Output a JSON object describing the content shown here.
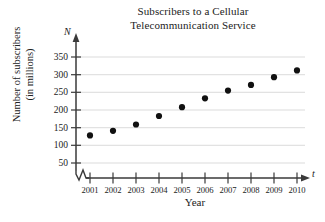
{
  "chart_data": {
    "type": "scatter",
    "title": "Subscribers to a Cellular Telecommunication Service",
    "title_lines": [
      "Subscribers to a Cellular",
      "Telecommunication Service"
    ],
    "xlabel": "Year",
    "ylabel": "Number of subscribers (in millions)",
    "ylabel_lines": [
      "Number of subscribers",
      "(in millions)"
    ],
    "x_axis_variable": "t",
    "y_axis_variable": "N",
    "x": [
      2001,
      2002,
      2003,
      2004,
      2005,
      2006,
      2007,
      2008,
      2009,
      2010
    ],
    "values": [
      128,
      141,
      159,
      183,
      208,
      233,
      255,
      271,
      293,
      312
    ],
    "xticks": [
      "2001",
      "2002",
      "2003",
      "2004",
      "2005",
      "2006",
      "2007",
      "2008",
      "2009",
      "2010"
    ],
    "yticks": [
      "50",
      "100",
      "150",
      "200",
      "250",
      "300",
      "350"
    ],
    "ytick_values": [
      50,
      100,
      150,
      200,
      250,
      300,
      350
    ],
    "xlim": [
      2000.6,
      2010.6
    ],
    "ylim": [
      0,
      365
    ],
    "grid": "horizontal",
    "legend": "none",
    "axis_break": "y-origin zigzag",
    "marker": "filled-circle",
    "colors": {
      "background": "#ffffff",
      "axis": "#3a3a3a",
      "gridline": "#cfcfcf",
      "marker": "#111111",
      "text": "#222222"
    }
  }
}
